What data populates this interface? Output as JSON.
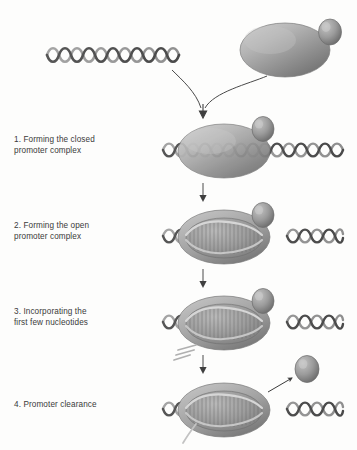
{
  "figure": {
    "background_color": "#fdfdfc",
    "width": 357,
    "height": 450
  },
  "colors": {
    "dna_dark": "#4a4a4a",
    "dna_light": "#9a9a9a",
    "enzyme_light": "#bfbfbf",
    "enzyme_mid": "#9d9d9d",
    "enzyme_dark": "#6f6f6f",
    "sigma_light": "#b8b8b8",
    "sigma_dark": "#6a6a6a",
    "arrow": "#3f3f3f",
    "text": "#3a3a3a",
    "rna": "#b0b0b0"
  },
  "components": {
    "dna_label": "DNA double helix",
    "polymerase_label": "RNA polymerase core enzyme",
    "sigma_label": "sigma factor",
    "rna_label": "nascent RNA transcript"
  },
  "steps": [
    {
      "number": "1.",
      "text": "1. Forming the closed\n     promoter complex",
      "line1": "1. Forming the closed",
      "line2": "promoter complex",
      "state": "closed-complex"
    },
    {
      "number": "2.",
      "text": "2. Forming the open\n     promoter complex",
      "line1": "2. Forming the open",
      "line2": "promoter complex",
      "state": "open-complex"
    },
    {
      "number": "3.",
      "text": "3. Incorporating the\n     first few nucleotides",
      "line1": "3. Incorporating the",
      "line2": "first few nucleotides",
      "state": "initial-transcription"
    },
    {
      "number": "4.",
      "text": "4. Promoter clearance",
      "line1": "4. Promoter clearance",
      "line2": "",
      "state": "promoter-clearance"
    }
  ],
  "top_scene": {
    "dna_caption": "free DNA duplex",
    "holoenzyme_caption": "RNA polymerase holoenzyme with sigma factor",
    "converging_arrows": 2
  }
}
